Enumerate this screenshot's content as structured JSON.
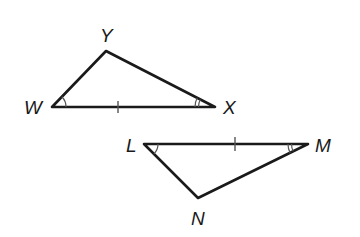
{
  "diagram": {
    "triangles": [
      {
        "name": "triangle-WXY",
        "vertices": {
          "W": {
            "label": "W",
            "x": 52,
            "y": 107
          },
          "Y": {
            "label": "Y",
            "x": 106,
            "y": 51
          },
          "X": {
            "label": "X",
            "x": 215,
            "y": 107
          }
        },
        "marks": {
          "side_WX": "single tick",
          "angle_W": "single arc",
          "angle_X": "double arc"
        }
      },
      {
        "name": "triangle-LMN",
        "vertices": {
          "L": {
            "label": "L",
            "x": 144,
            "y": 144
          },
          "M": {
            "label": "M",
            "x": 308,
            "y": 144
          },
          "N": {
            "label": "N",
            "x": 198,
            "y": 198
          }
        },
        "marks": {
          "side_LM": "single tick",
          "angle_L": "single arc",
          "angle_M": "double arc"
        }
      }
    ],
    "labels": {
      "W": "W",
      "X": "X",
      "Y": "Y",
      "L": "L",
      "M": "M",
      "N": "N"
    },
    "colors": {
      "stroke": "#1a1a1a",
      "marks": "#555555",
      "background": "#ffffff"
    }
  }
}
